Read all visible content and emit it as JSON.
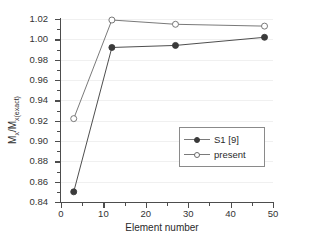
{
  "chart_data": {
    "type": "line",
    "title": "",
    "xlabel": "Element number",
    "ylabel": "Mx/Mx(exact)",
    "ylabel_parts": {
      "m1": "M",
      "sub1": "x",
      "slash": "/M",
      "sub2": "x(exact)"
    },
    "xlim": [
      0,
      50
    ],
    "ylim": [
      0.84,
      1.02
    ],
    "xticks": [
      0,
      10,
      20,
      30,
      40,
      50
    ],
    "yticks": [
      0.84,
      0.86,
      0.88,
      0.9,
      0.92,
      0.94,
      0.96,
      0.98,
      1.0,
      1.02
    ],
    "xticklabels": [
      "0",
      "10",
      "20",
      "30",
      "40",
      "50"
    ],
    "yticklabels": [
      "0.84",
      "0.86",
      "0.88",
      "0.90",
      "0.92",
      "0.94",
      "0.96",
      "0.98",
      "1.00",
      "1.02"
    ],
    "grid": true,
    "legend_position": "center-right",
    "series": [
      {
        "name": "S1 [9]",
        "marker": "filled-circle",
        "color": "#3a3a3a",
        "x": [
          3,
          12,
          27,
          48
        ],
        "values": [
          0.85,
          0.992,
          0.994,
          1.002
        ]
      },
      {
        "name": "present",
        "marker": "open-circle",
        "color": "#6a6a6a",
        "x": [
          3,
          12,
          27,
          48
        ],
        "values": [
          0.922,
          1.019,
          1.0148,
          1.013
        ]
      }
    ]
  },
  "legend": {
    "items": [
      {
        "label": "S1 [9]"
      },
      {
        "label": "present"
      }
    ]
  },
  "colors": {
    "axis": "#4d4d4d",
    "grid": "#f0f0f0",
    "series_filled": "#3a3a3a",
    "series_open": "#6a6a6a",
    "background": "#ffffff"
  }
}
